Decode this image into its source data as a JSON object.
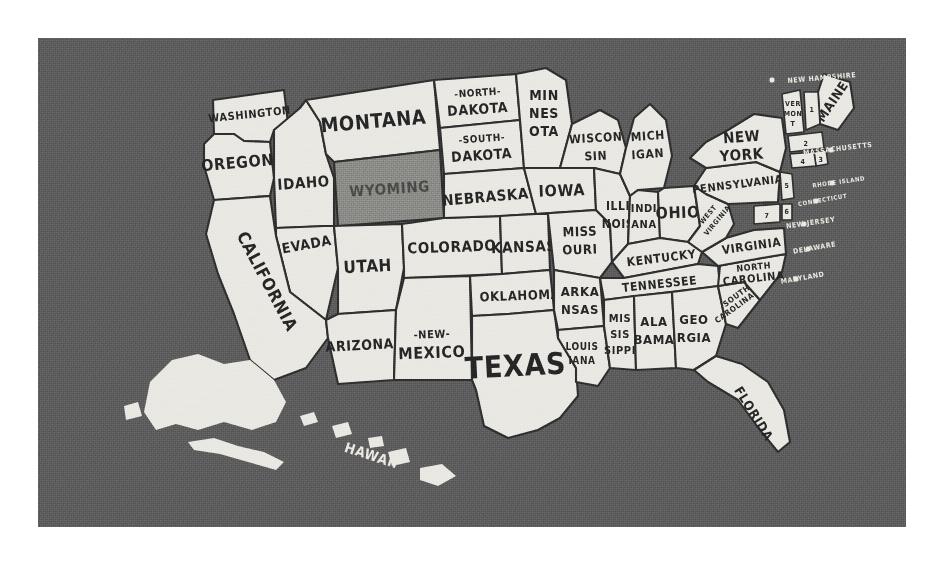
{
  "poster": {
    "title": "United States hand-lettered map poster",
    "background_color": "#5d5d5d",
    "land_color": "#e9e8e3",
    "outline_color": "#2f2f2f",
    "highlight_color": "#8b8b88",
    "highlighted_state": "WYOMING"
  },
  "states": {
    "washington": "WASHINGTON",
    "oregon": "OREGON",
    "idaho": "IDAHO",
    "montana": "MONTANA",
    "wyoming": "WYOMING",
    "nevada": "NEVADA",
    "utah": "UTAH",
    "california": "CALIFORNIA",
    "arizona": "ARIZONA",
    "colorado": "COLORADO",
    "new_mexico_line1": "-NEW-",
    "new_mexico_line2": "MEXICO",
    "north_dakota_line1": "-NORTH-",
    "north_dakota_line2": "DAKOTA",
    "south_dakota_line1": "-SOUTH-",
    "south_dakota_line2": "DAKOTA",
    "nebraska": "NEBRASKA",
    "kansas": "KANSAS",
    "oklahoma": "OKLAHOMA",
    "texas": "TEXAS",
    "minnesota_line1": "MIN",
    "minnesota_line2": "NES",
    "minnesota_line3": "OTA",
    "iowa": "IOWA",
    "missouri_line1": "MISS",
    "missouri_line2": "OURI",
    "arkansas_line1": "ARKA",
    "arkansas_line2": "NSAS",
    "louisiana_line1": "LOUIS",
    "louisiana_line2": "IANA",
    "wisconsin_line1": "WISCON",
    "wisconsin_line2": "SIN",
    "illinois_line1": "ILLI",
    "illinois_line2": "NOIS",
    "michigan_line1": "MICH",
    "michigan_line2": "IGAN",
    "indiana_line1": "INDI",
    "indiana_line2": "ANA",
    "ohio": "OHIO",
    "kentucky": "KENTUCKY",
    "tennessee": "TENNESSEE",
    "mississippi_line1": "MIS",
    "mississippi_line2": "SIS",
    "mississippi_line3": "SIPPI",
    "alabama_line1": "ALA",
    "alabama_line2": "BAMA",
    "georgia_line1": "GEO",
    "georgia_line2": "RGIA",
    "florida": "FLORIDA",
    "south_carolina_line1": "SOUTH",
    "south_carolina_line2": "CAROLINA",
    "north_carolina_line1": "NORTH",
    "north_carolina_line2": "CAROLINA",
    "virginia": "VIRGINIA",
    "west_virginia_line1": "WEST",
    "west_virginia_line2": "VIRGINIA",
    "pennsylvania": "PENNSYLVANIA",
    "new_york_line1": "NEW",
    "new_york_line2": "YORK",
    "vermont_line1": "VER",
    "vermont_line2": "MON",
    "vermont_line3": "T",
    "maine": "MAINE",
    "alaska": "ALASKA",
    "hawaii": "HAWAII"
  },
  "callouts": [
    {
      "number": "1",
      "label": "NEW HAMPSHIRE"
    },
    {
      "number": "2",
      "label": "MASSACHUSETTS"
    },
    {
      "number": "3",
      "label": "RHODE ISLAND"
    },
    {
      "number": "4",
      "label": "CONNECTICUT"
    },
    {
      "number": "5",
      "label": "NEW JERSEY"
    },
    {
      "number": "6",
      "label": "DELAWARE"
    },
    {
      "number": "7",
      "label": "MARYLAND"
    }
  ]
}
